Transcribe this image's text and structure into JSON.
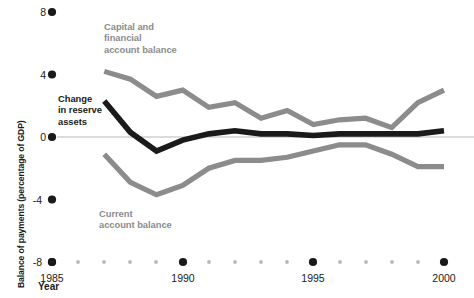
{
  "chart_data": {
    "type": "line",
    "title": "",
    "subtitle": "",
    "xlabel": "Year",
    "ylabel": "Balance of payments (percentage of GDP)",
    "xlim": [
      1985,
      2000
    ],
    "ylim": [
      -8,
      8
    ],
    "xticks": [
      1985,
      1990,
      1995,
      2000
    ],
    "xtick_labels": [
      "1985",
      "1990",
      "1995",
      "2000"
    ],
    "yticks": [
      8,
      4,
      0,
      -4,
      -8
    ],
    "ytick_labels": [
      "8",
      "4",
      "0",
      "-4",
      "-8"
    ],
    "minor_xticks": [
      1986,
      1987,
      1988,
      1989,
      1991,
      1992,
      1993,
      1994,
      1996,
      1997,
      1998,
      1999
    ],
    "grid": false,
    "zero_line": true,
    "legend": "inline-annotations",
    "x": [
      1987,
      1988,
      1989,
      1990,
      1991,
      1992,
      1993,
      1994,
      1995,
      1996,
      1997,
      1998,
      1999,
      2000
    ],
    "series": [
      {
        "name": "Capital and financial account balance",
        "color": "#8c8c8c",
        "values": [
          4.2,
          3.7,
          2.6,
          3.0,
          1.9,
          2.2,
          1.2,
          1.7,
          0.8,
          1.1,
          1.2,
          0.6,
          2.2,
          3.0
        ]
      },
      {
        "name": "Current account balance",
        "color": "#8c8c8c",
        "values": [
          -1.1,
          -2.9,
          -3.7,
          -3.1,
          -2.0,
          -1.5,
          -1.5,
          -1.3,
          -0.9,
          -0.5,
          -0.5,
          -1.1,
          -1.9,
          -1.9
        ]
      },
      {
        "name": "Change in reserve assets",
        "color": "#1a1a1a",
        "values": [
          2.3,
          0.3,
          -0.9,
          -0.2,
          0.2,
          0.4,
          0.2,
          0.2,
          0.1,
          0.2,
          0.2,
          0.2,
          0.2,
          0.4
        ]
      }
    ],
    "annotations": [
      {
        "name": "capital-label",
        "text": "Capital and\nfinancial\naccount balance",
        "color": "#8c8c8c"
      },
      {
        "name": "current-label",
        "text": "Current\naccount balance",
        "color": "#8c8c8c"
      },
      {
        "name": "reserve-label",
        "text": "Change\nin reserve\nassets",
        "color": "#1a1a1a"
      }
    ]
  },
  "axes": {
    "y_title": "Balance of payments (percentage of GDP)",
    "x_title": "Year",
    "y_labels": [
      "8",
      "4",
      "0",
      "-4",
      "-8"
    ],
    "x_labels": [
      "1985",
      "1990",
      "1995",
      "2000"
    ]
  },
  "annotations": {
    "capital": "Capital and\nfinancial\naccount balance",
    "current": "Current\naccount balance",
    "reserve": "Change\nin reserve\nassets"
  },
  "colors": {
    "series_grey": "#8c8c8c",
    "series_black": "#1a1a1a",
    "zero_line": "#cfcfcf",
    "tick_dot": "#1a1a1a",
    "minor_tick_dot": "#b8b8b8",
    "background": "#ffffff"
  }
}
